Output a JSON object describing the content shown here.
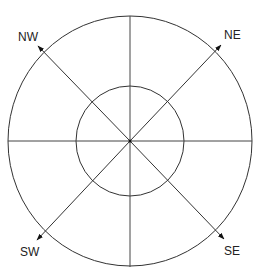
{
  "diagram": {
    "type": "compass-rose",
    "center": {
      "x": 130,
      "y": 141
    },
    "outer_circle": {
      "rx": 122,
      "ry": 125
    },
    "inner_circle": {
      "rx": 54,
      "ry": 55
    },
    "axes": [
      "horizontal",
      "vertical"
    ],
    "directions": [
      {
        "id": "nw",
        "label": "NW"
      },
      {
        "id": "ne",
        "label": "NE"
      },
      {
        "id": "sw",
        "label": "SW"
      },
      {
        "id": "se",
        "label": "SE"
      }
    ],
    "colors": {
      "line": "#333333",
      "text": "#222222",
      "background": "#ffffff"
    }
  }
}
